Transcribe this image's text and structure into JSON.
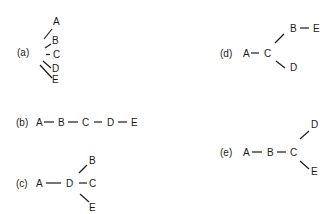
{
  "panels": {
    "a": {
      "label": "(a)",
      "nodes": {
        "A": "A",
        "B": "B",
        "C": "C",
        "D": "D",
        "E": "E"
      },
      "description": "Five labels stacked vertically with short strokes to their left"
    },
    "b": {
      "label": "(b)",
      "nodes": {
        "A": "A",
        "B": "B",
        "C": "C",
        "D": "D",
        "E": "E"
      },
      "edges": [
        [
          "A",
          "B"
        ],
        [
          "B",
          "C"
        ],
        [
          "C",
          "D"
        ],
        [
          "D",
          "E"
        ]
      ]
    },
    "c": {
      "label": "(c)",
      "nodes": {
        "A": "A",
        "B": "B",
        "C": "C",
        "D": "D",
        "E": "E"
      },
      "edges": [
        [
          "A",
          "D"
        ],
        [
          "D",
          "B"
        ],
        [
          "D",
          "C"
        ],
        [
          "D",
          "E"
        ]
      ]
    },
    "d": {
      "label": "(d)",
      "nodes": {
        "A": "A",
        "B": "B",
        "C": "C",
        "D": "D",
        "E": "E"
      },
      "edges": [
        [
          "A",
          "C"
        ],
        [
          "C",
          "B"
        ],
        [
          "B",
          "E"
        ],
        [
          "C",
          "D"
        ]
      ]
    },
    "e": {
      "label": "(e)",
      "nodes": {
        "A": "A",
        "B": "B",
        "C": "C",
        "D": "D",
        "E": "E"
      },
      "edges": [
        [
          "A",
          "B"
        ],
        [
          "B",
          "C"
        ],
        [
          "C",
          "D"
        ],
        [
          "C",
          "E"
        ]
      ]
    }
  }
}
